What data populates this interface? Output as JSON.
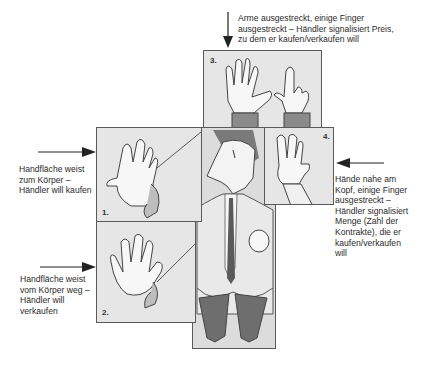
{
  "figure": {
    "panels": [
      {
        "id": "1",
        "label": "1.",
        "caption": "Handfläche weist\nzum Körper –\nHändler will kaufen"
      },
      {
        "id": "2",
        "label": "2.",
        "caption": "Handfläche weist\nvom Körper weg –\nHändler will\nverkaufen"
      },
      {
        "id": "3",
        "label": "3.",
        "caption": "Arme ausgestreckt, einige Finger\nausgestreckt – Händler signalisiert Preis,\nzu dem er kaufen/verkaufen will"
      },
      {
        "id": "4",
        "label": "4.",
        "caption": "Hände nahe am\nKopf, einige Finger\nausgestreckt –\nHändler signalisiert\nMenge (Zahl der\nKontrakte), die er\nkaufen/verkaufen\nwill"
      }
    ],
    "colors": {
      "panel_fill": "#e6e6e6",
      "panel_border": "#5a5a5a",
      "hand_fill": "#f7f7f7",
      "suit_dark": "#6e6e6e",
      "arrow": "#222222"
    }
  }
}
